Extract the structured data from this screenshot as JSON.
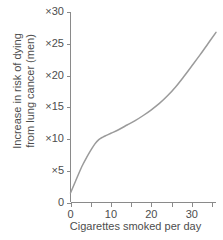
{
  "chart_data": {
    "type": "line",
    "title": "",
    "subtitle": "",
    "xlabel": "Cigarettes smoked per day",
    "ylabel_line1": "Increase in risk of dying",
    "ylabel_line2": "from lung cancer (men)",
    "ylabel": "Increase in risk of dying from lung cancer (men)",
    "xlim": [
      0,
      36
    ],
    "ylim": [
      0,
      30
    ],
    "grid": false,
    "legend": false,
    "legend_position": "none",
    "series_color": "#9b9b9b",
    "axis_color": "#8a8a8a",
    "text_color": "#4d4d4d",
    "background": "#ffffff",
    "x_ticks_major": [
      0,
      10,
      20,
      30
    ],
    "x_ticks_minor": [
      5,
      15,
      25,
      35
    ],
    "x_tick_labels": [
      "0",
      "10",
      "20",
      "30"
    ],
    "y_ticks": [
      0,
      5,
      10,
      15,
      20,
      25,
      30
    ],
    "y_tick_labels": [
      "0",
      "×5",
      "×10",
      "×15",
      "×20",
      "×25",
      "×30"
    ],
    "series": [
      {
        "name": "Increase in risk of dying from lung cancer (men)",
        "x": [
          0,
          1,
          2,
          3,
          4,
          5,
          6,
          7,
          8,
          9,
          10,
          12,
          14,
          16,
          18,
          20,
          22,
          24,
          26,
          28,
          30,
          32,
          34,
          36
        ],
        "values": [
          1.5,
          3.0,
          4.5,
          5.9,
          7.1,
          8.2,
          9.2,
          9.9,
          10.3,
          10.6,
          10.9,
          11.5,
          12.2,
          12.9,
          13.7,
          14.6,
          15.6,
          16.8,
          18.2,
          19.8,
          21.5,
          23.2,
          25.0,
          26.8
        ]
      }
    ]
  }
}
